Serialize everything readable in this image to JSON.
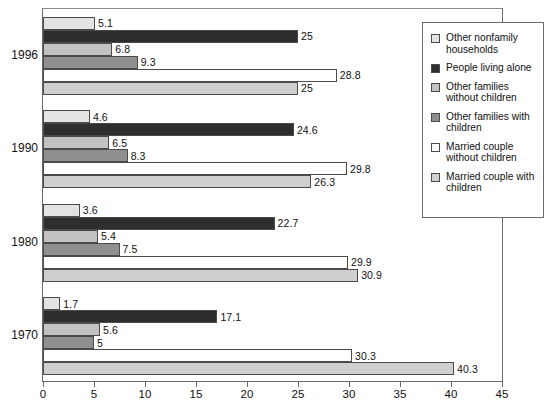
{
  "chart_data": {
    "type": "bar",
    "orientation": "horizontal",
    "title": "",
    "subtitle": "",
    "xlabel": "",
    "ylabel": "",
    "xlim": [
      0,
      45
    ],
    "xticks": [
      0,
      5,
      10,
      15,
      20,
      25,
      30,
      35,
      40,
      45
    ],
    "xtick_labels": [
      "0",
      "5",
      "10",
      "15",
      "20",
      "25",
      "30",
      "35",
      "40",
      "45"
    ],
    "grid": false,
    "legend_position": "top-right",
    "categories": [
      "1996",
      "1990",
      "1980",
      "1970"
    ],
    "series": [
      {
        "name": "Other nonfamily households",
        "color": "#e3e3e3",
        "values": [
          5.1,
          4.6,
          3.6,
          1.7
        ],
        "labels": [
          "5.1",
          "4.6",
          "3.6",
          "1.7"
        ]
      },
      {
        "name": "People living alone",
        "color": "#2e2e2e",
        "values": [
          25,
          24.6,
          22.7,
          17.1
        ],
        "labels": [
          "25",
          "24.6",
          "22.7",
          "17.1"
        ]
      },
      {
        "name": "Other families without children",
        "color": "#c2c2c2",
        "values": [
          6.8,
          6.5,
          5.4,
          5.6
        ],
        "labels": [
          "6.8",
          "6.5",
          "5.4",
          "5.6"
        ]
      },
      {
        "name": "Other families with children",
        "color": "#8f8f8f",
        "values": [
          9.3,
          8.3,
          7.5,
          5
        ],
        "labels": [
          "9.3",
          "8.3",
          "7.5",
          "5"
        ]
      },
      {
        "name": "Married couple without children",
        "color": "#ffffff",
        "values": [
          28.8,
          29.8,
          29.9,
          30.3
        ],
        "labels": [
          "28.8",
          "29.8",
          "29.9",
          "30.3"
        ]
      },
      {
        "name": "Married couple with children",
        "color": "#cfcfcf",
        "values": [
          25,
          26.3,
          30.9,
          40.3
        ],
        "labels": [
          "25",
          "26.3",
          "30.9",
          "40.3"
        ]
      }
    ]
  },
  "legend": {
    "items": [
      {
        "label": "Other nonfamily households",
        "color": "#e3e3e3"
      },
      {
        "label": "People living alone",
        "color": "#2e2e2e"
      },
      {
        "label": "Other families without children",
        "color": "#c2c2c2"
      },
      {
        "label": "Other families with children",
        "color": "#8f8f8f"
      },
      {
        "label": "Married couple without children",
        "color": "#ffffff"
      },
      {
        "label": "Married couple with children",
        "color": "#cfcfcf"
      }
    ]
  },
  "axis": {
    "year_labels": [
      "1996",
      "1990",
      "1980",
      "1970"
    ]
  }
}
